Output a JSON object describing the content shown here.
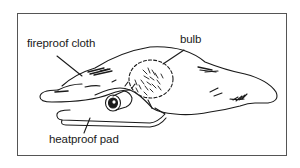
{
  "diagram": {
    "labels": {
      "fireproof_cloth": "fireproof cloth",
      "bulb": "bulb",
      "heatproof_pad": "heatproof pad"
    },
    "colors": {
      "line": "#1a1a1a",
      "frame": "#555555",
      "background": "#ffffff"
    }
  }
}
